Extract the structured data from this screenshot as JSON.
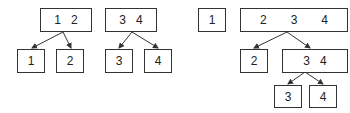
{
  "diagram": {
    "trees": [
      {
        "id": "left",
        "root": {
          "keys": [
            "1",
            "2"
          ]
        },
        "children": [
          {
            "keys": [
              "1"
            ]
          },
          {
            "keys": [
              "2"
            ]
          }
        ]
      },
      {
        "id": "middle",
        "root": {
          "keys": [
            "3",
            "4"
          ]
        },
        "children": [
          {
            "keys": [
              "3"
            ]
          },
          {
            "keys": [
              "4"
            ]
          }
        ]
      },
      {
        "id": "right-single",
        "root": {
          "keys": [
            "1"
          ]
        }
      },
      {
        "id": "right",
        "root": {
          "keys": [
            "2",
            "3",
            "4"
          ]
        },
        "children": [
          {
            "keys": [
              "2"
            ]
          },
          {
            "keys": [
              "3",
              "4"
            ],
            "children": [
              {
                "keys": [
                  "3"
                ]
              },
              {
                "keys": [
                  "4"
                ]
              }
            ]
          }
        ]
      }
    ],
    "colors": {
      "stroke": "#333333",
      "background": "#ffffff",
      "text": "#222222"
    }
  }
}
